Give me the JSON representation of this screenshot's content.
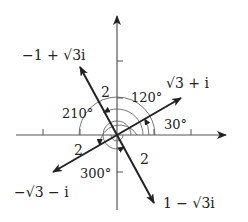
{
  "diagram": {
    "type": "complex-plane-vectors",
    "colors": {
      "ink": "#222222",
      "axis": "#555555",
      "arc": "#666666",
      "background": "#ffffff"
    },
    "vectors": [
      {
        "label": "√3 + i",
        "modulus_label": "2",
        "angle_label": "30°",
        "angle_deg": 30
      },
      {
        "label": "−1 + √3i",
        "modulus_label": "2",
        "angle_label": "120°",
        "angle_deg": 120
      },
      {
        "label": "−√3 − i",
        "modulus_label": "2",
        "angle_label": "210°",
        "angle_deg": 210
      },
      {
        "label": "1 − √3i",
        "modulus_label": "2",
        "angle_label": "300°",
        "angle_deg": 300
      }
    ]
  }
}
